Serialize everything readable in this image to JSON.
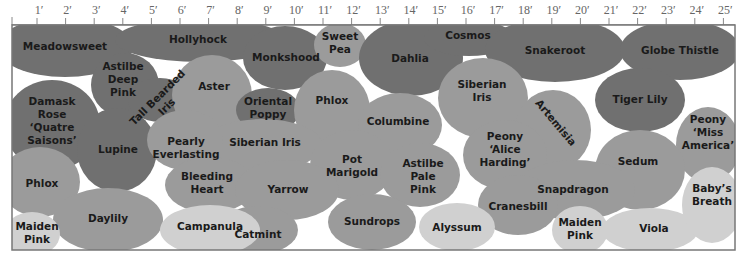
{
  "colors": {
    "dark": "#707070",
    "medium": "#9b9b9b",
    "light": "#d0d0d0",
    "background": "#ffffff",
    "ruler": "#888888",
    "border": "#777777"
  },
  "ruler": {
    "origin_x": 37,
    "px_per_foot": 28.6,
    "y": 25,
    "ticks": [
      "1′",
      "2′",
      "3′",
      "4′",
      "5′",
      "6′",
      "7′",
      "8′",
      "9′",
      "10′",
      "11′",
      "12′",
      "13′",
      "14′",
      "15′",
      "16′",
      "17′",
      "18′",
      "19′",
      "20′",
      "21′",
      "22′",
      "23′",
      "24′",
      "25′"
    ]
  },
  "plot": {
    "x": 12,
    "y": 25,
    "width": 723,
    "height": 225
  },
  "beds": [
    {
      "name": "Meadowsweet",
      "shade": "dark",
      "cx": 65,
      "cy": 47,
      "rx": 68,
      "ry": 30,
      "lines": [
        "Meadowsweet"
      ],
      "lx": 65,
      "ly": 50
    },
    {
      "name": "Hollyhock",
      "shade": "dark",
      "cx": 200,
      "cy": 40,
      "rx": 85,
      "ry": 22,
      "lines": [
        "Hollyhock"
      ],
      "lx": 198,
      "ly": 43
    },
    {
      "name": "Astilbe Deep Pink",
      "shade": "dark",
      "cx": 125,
      "cy": 85,
      "rx": 34,
      "ry": 32,
      "lines": [
        "Astilbe",
        "Deep",
        "Pink"
      ],
      "lx": 123,
      "ly": 70
    },
    {
      "name": "Tall Bearded Iris",
      "shade": "dark",
      "cx": 160,
      "cy": 100,
      "rx": 32,
      "ry": 22,
      "lines": [
        "Tall Bearded",
        "Iris"
      ],
      "lx": 160,
      "ly": 100,
      "rotate": -45
    },
    {
      "name": "Damask Rose 'Quatre Saisons'",
      "shade": "dark",
      "cx": 52,
      "cy": 125,
      "rx": 48,
      "ry": 45,
      "lines": [
        "Damask",
        "Rose",
        "‘Quatre",
        "Saisons’"
      ],
      "lx": 52,
      "ly": 105
    },
    {
      "name": "Lupine",
      "shade": "dark",
      "cx": 117,
      "cy": 150,
      "rx": 40,
      "ry": 42,
      "lines": [
        "Lupine"
      ],
      "lx": 118,
      "ly": 153
    },
    {
      "name": "Aster",
      "shade": "medium",
      "cx": 212,
      "cy": 95,
      "rx": 40,
      "ry": 40,
      "lines": [
        "Aster"
      ],
      "lx": 214,
      "ly": 90
    },
    {
      "name": "Monkshood",
      "shade": "dark",
      "cx": 285,
      "cy": 58,
      "rx": 42,
      "ry": 32,
      "lines": [
        "Monkshood"
      ],
      "lx": 286,
      "ly": 61
    },
    {
      "name": "Oriental Poppy",
      "shade": "dark",
      "cx": 268,
      "cy": 110,
      "rx": 32,
      "ry": 22,
      "lines": [
        "Oriental",
        "Poppy"
      ],
      "lx": 268,
      "ly": 105
    },
    {
      "name": "Sweet Pea",
      "shade": "medium",
      "cx": 340,
      "cy": 45,
      "rx": 26,
      "ry": 22,
      "lines": [
        "Sweet",
        "Pea"
      ],
      "lx": 340,
      "ly": 40
    },
    {
      "name": "Dahlia",
      "shade": "dark",
      "cx": 411,
      "cy": 58,
      "rx": 52,
      "ry": 38,
      "lines": [
        "Dahlia"
      ],
      "lx": 410,
      "ly": 62
    },
    {
      "name": "Cosmos",
      "shade": "dark",
      "cx": 469,
      "cy": 38,
      "rx": 45,
      "ry": 18,
      "lines": [
        "Cosmos"
      ],
      "lx": 468,
      "ly": 39
    },
    {
      "name": "Snakeroot",
      "shade": "dark",
      "cx": 555,
      "cy": 50,
      "rx": 70,
      "ry": 32,
      "lines": [
        "Snakeroot"
      ],
      "lx": 555,
      "ly": 54
    },
    {
      "name": "Globe Thistle",
      "shade": "dark",
      "cx": 680,
      "cy": 50,
      "rx": 60,
      "ry": 30,
      "lines": [
        "Globe Thistle"
      ],
      "lx": 680,
      "ly": 54
    },
    {
      "name": "Phlox (center)",
      "shade": "medium",
      "cx": 332,
      "cy": 110,
      "rx": 38,
      "ry": 40,
      "lines": [
        "Phlox"
      ],
      "lx": 332,
      "ly": 104
    },
    {
      "name": "Siberian Iris (left)",
      "shade": "medium",
      "cx": 262,
      "cy": 145,
      "rx": 60,
      "ry": 26,
      "lines": [
        "Siberian Iris"
      ],
      "lx": 265,
      "ly": 146
    },
    {
      "name": "Pearly Everlasting",
      "shade": "medium",
      "cx": 185,
      "cy": 140,
      "rx": 38,
      "ry": 30,
      "lines": [
        "Pearly",
        "Everlasting"
      ],
      "lx": 186,
      "ly": 145
    },
    {
      "name": "Bleeding Heart",
      "shade": "medium",
      "cx": 210,
      "cy": 185,
      "rx": 45,
      "ry": 28,
      "lines": [
        "Bleeding",
        "Heart"
      ],
      "lx": 207,
      "ly": 180
    },
    {
      "name": "Columbine",
      "shade": "medium",
      "cx": 400,
      "cy": 125,
      "rx": 42,
      "ry": 32,
      "lines": [
        "Columbine"
      ],
      "lx": 398,
      "ly": 125
    },
    {
      "name": "Siberian Iris (right)",
      "shade": "medium",
      "cx": 483,
      "cy": 98,
      "rx": 45,
      "ry": 40,
      "lines": [
        "Siberian",
        "Iris"
      ],
      "lx": 482,
      "ly": 88
    },
    {
      "name": "Artemisia",
      "shade": "medium",
      "cx": 553,
      "cy": 130,
      "rx": 38,
      "ry": 40,
      "lines": [
        "Artemisia"
      ],
      "lx": 553,
      "ly": 125,
      "rotate": 50
    },
    {
      "name": "Peony 'Alice Harding'",
      "shade": "medium",
      "cx": 505,
      "cy": 155,
      "rx": 42,
      "ry": 35,
      "lines": [
        "Peony",
        "‘Alice",
        "Harding’"
      ],
      "lx": 505,
      "ly": 140
    },
    {
      "name": "Tiger Lily",
      "shade": "dark",
      "cx": 640,
      "cy": 100,
      "rx": 45,
      "ry": 32,
      "lines": [
        "Tiger Lily"
      ],
      "lx": 640,
      "ly": 103
    },
    {
      "name": "Peony 'Miss America'",
      "shade": "medium",
      "cx": 708,
      "cy": 145,
      "rx": 32,
      "ry": 38,
      "lines": [
        "Peony",
        "‘Miss",
        "America’"
      ],
      "lx": 708,
      "ly": 123
    },
    {
      "name": "Sedum",
      "shade": "medium",
      "cx": 640,
      "cy": 170,
      "rx": 45,
      "ry": 40,
      "lines": [
        "Sedum"
      ],
      "lx": 638,
      "ly": 165
    },
    {
      "name": "Phlox (left)",
      "shade": "medium",
      "cx": 40,
      "cy": 182,
      "rx": 40,
      "ry": 35,
      "lines": [
        "Phlox"
      ],
      "lx": 42,
      "ly": 187
    },
    {
      "name": "Pot Marigold",
      "shade": "medium",
      "cx": 352,
      "cy": 165,
      "rx": 42,
      "ry": 35,
      "lines": [
        "Pot",
        "Marigold"
      ],
      "lx": 352,
      "ly": 163
    },
    {
      "name": "Astilbe Pale Pink",
      "shade": "medium",
      "cx": 420,
      "cy": 175,
      "rx": 40,
      "ry": 32,
      "lines": [
        "Astilbe",
        "Pale",
        "Pink"
      ],
      "lx": 423,
      "ly": 167
    },
    {
      "name": "Yarrow",
      "shade": "medium",
      "cx": 287,
      "cy": 190,
      "rx": 52,
      "ry": 30,
      "lines": [
        "Yarrow"
      ],
      "lx": 288,
      "ly": 193
    },
    {
      "name": "Snapdragon",
      "shade": "medium",
      "cx": 575,
      "cy": 190,
      "rx": 60,
      "ry": 30,
      "lines": [
        "Snapdragon"
      ],
      "lx": 573,
      "ly": 193
    },
    {
      "name": "Cranesbill",
      "shade": "medium",
      "cx": 518,
      "cy": 205,
      "rx": 40,
      "ry": 30,
      "lines": [
        "Cranesbill"
      ],
      "lx": 518,
      "ly": 210
    },
    {
      "name": "Daylily",
      "shade": "medium",
      "cx": 108,
      "cy": 220,
      "rx": 55,
      "ry": 32,
      "lines": [
        "Daylily"
      ],
      "lx": 108,
      "ly": 222
    },
    {
      "name": "Catmint",
      "shade": "medium",
      "cx": 258,
      "cy": 230,
      "rx": 40,
      "ry": 24,
      "lines": [
        "Catmint"
      ],
      "lx": 258,
      "ly": 238
    },
    {
      "name": "Sundrops",
      "shade": "medium",
      "cx": 372,
      "cy": 222,
      "rx": 44,
      "ry": 28,
      "lines": [
        "Sundrops"
      ],
      "lx": 372,
      "ly": 225
    },
    {
      "name": "Maiden Pink (left)",
      "shade": "light",
      "cx": 32,
      "cy": 234,
      "rx": 28,
      "ry": 22,
      "lines": [
        "Maiden",
        "Pink"
      ],
      "lx": 37,
      "ly": 230
    },
    {
      "name": "Campanula",
      "shade": "light",
      "cx": 210,
      "cy": 230,
      "rx": 50,
      "ry": 25,
      "lines": [
        "Campanula"
      ],
      "lx": 210,
      "ly": 230
    },
    {
      "name": "Alyssum",
      "shade": "light",
      "cx": 457,
      "cy": 227,
      "rx": 38,
      "ry": 24,
      "lines": [
        "Alyssum"
      ],
      "lx": 457,
      "ly": 231
    },
    {
      "name": "Maiden Pink (right)",
      "shade": "light",
      "cx": 580,
      "cy": 230,
      "rx": 28,
      "ry": 24,
      "lines": [
        "Maiden",
        "Pink"
      ],
      "lx": 580,
      "ly": 226
    },
    {
      "name": "Viola",
      "shade": "light",
      "cx": 650,
      "cy": 230,
      "rx": 48,
      "ry": 22,
      "lines": [
        "Viola"
      ],
      "lx": 654,
      "ly": 232
    },
    {
      "name": "Baby's Breath",
      "shade": "light",
      "cx": 712,
      "cy": 205,
      "rx": 30,
      "ry": 38,
      "lines": [
        "Baby’s",
        "Breath"
      ],
      "lx": 712,
      "ly": 192
    }
  ]
}
